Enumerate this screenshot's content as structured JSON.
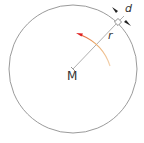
{
  "diagram": {
    "title": "",
    "labels": {
      "center": "M",
      "radius": "r",
      "thickness": "d"
    },
    "colors": {
      "circle": "#808080",
      "radius_line": "#9a9a9a",
      "arc": "#e8a060",
      "arrowhead": "#e02020",
      "markers": "#222222"
    },
    "elements": [
      {
        "type": "circle",
        "center": [
          73,
          69
        ],
        "radius": 64
      },
      {
        "type": "line",
        "name": "radius",
        "from": [
          73,
          69
        ],
        "to": [
          118,
          22
        ],
        "label": "r"
      },
      {
        "type": "square",
        "name": "small-element",
        "at": [
          118,
          22
        ]
      },
      {
        "type": "arc",
        "name": "rotation-direction",
        "direction": "counterclockwise"
      },
      {
        "type": "label",
        "name": "center",
        "text": "M"
      },
      {
        "type": "dimension",
        "name": "thickness",
        "text": "d"
      }
    ]
  }
}
